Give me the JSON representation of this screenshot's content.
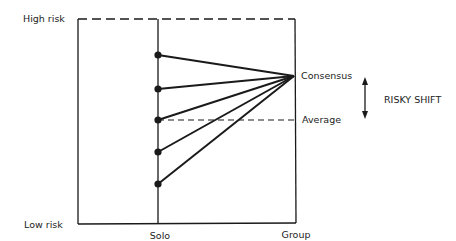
{
  "diagram": {
    "type": "risky-shift",
    "y_axis": {
      "top_label": "High risk",
      "bottom_label": "Low risk"
    },
    "x_axis": {
      "solo_label": "Solo",
      "group_label": "Group"
    },
    "annotations": {
      "consensus": "Consensus",
      "average": "Average",
      "shift": "RISKY SHIFT"
    },
    "solo_points_count": 5,
    "colors": {
      "line": "#1a1a1a",
      "text": "#222222",
      "background": "#ffffff"
    }
  }
}
